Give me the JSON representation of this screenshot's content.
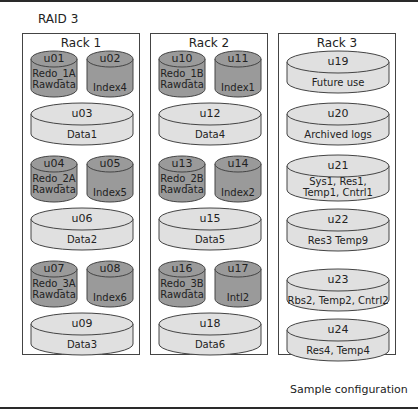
{
  "diagram": {
    "title": "RAID 3",
    "caption": "Sample configuration",
    "colors": {
      "small_disk": "#9a9a9a",
      "large_disk": "#e0e0e0",
      "border": "#444444"
    },
    "racks": [
      {
        "label": "Rack 1",
        "groups": [
          {
            "small": [
              {
                "id": "u01",
                "lines": [
                  "Redo_1A",
                  "Rawdata"
                ]
              },
              {
                "id": "u02",
                "lines": [
                  "Index4"
                ]
              }
            ],
            "large": {
              "id": "u03",
              "lines": [
                "Data1"
              ]
            }
          },
          {
            "small": [
              {
                "id": "u04",
                "lines": [
                  "Redo_2A",
                  "Rawdata"
                ]
              },
              {
                "id": "u05",
                "lines": [
                  "Index5"
                ]
              }
            ],
            "large": {
              "id": "u06",
              "lines": [
                "Data2"
              ]
            }
          },
          {
            "small": [
              {
                "id": "u07",
                "lines": [
                  "Redo_3A",
                  "Rawdata"
                ]
              },
              {
                "id": "u08",
                "lines": [
                  "Index6"
                ]
              }
            ],
            "large": {
              "id": "u09",
              "lines": [
                "Data3"
              ]
            }
          }
        ]
      },
      {
        "label": "Rack 2",
        "groups": [
          {
            "small": [
              {
                "id": "u10",
                "lines": [
                  "Redo_1B",
                  "Rawdata"
                ]
              },
              {
                "id": "u11",
                "lines": [
                  "Index1"
                ]
              }
            ],
            "large": {
              "id": "u12",
              "lines": [
                "Data4"
              ]
            }
          },
          {
            "small": [
              {
                "id": "u13",
                "lines": [
                  "Redo_2B",
                  "Rawdata"
                ]
              },
              {
                "id": "u14",
                "lines": [
                  "Index2"
                ]
              }
            ],
            "large": {
              "id": "u15",
              "lines": [
                "Data5"
              ]
            }
          },
          {
            "small": [
              {
                "id": "u16",
                "lines": [
                  "Redo_3B",
                  "Rawdata"
                ]
              },
              {
                "id": "u17",
                "lines": [
                  "Intl2"
                ]
              }
            ],
            "large": {
              "id": "u18",
              "lines": [
                "Data6"
              ]
            }
          }
        ]
      },
      {
        "label": "Rack 3",
        "disks": [
          {
            "id": "u19",
            "lines": [
              "Future use"
            ]
          },
          {
            "id": "u20",
            "lines": [
              "Archived logs"
            ]
          },
          {
            "id": "u21",
            "lines": [
              "Sys1, Res1,",
              "Temp1, Cntrl1"
            ]
          },
          {
            "id": "u22",
            "lines": [
              "Res3 Temp9"
            ]
          },
          {
            "id": "u23",
            "lines": [
              "Rbs2, Temp2, Cntrl2"
            ]
          },
          {
            "id": "u24",
            "lines": [
              "Res4, Temp4"
            ]
          }
        ]
      }
    ]
  }
}
